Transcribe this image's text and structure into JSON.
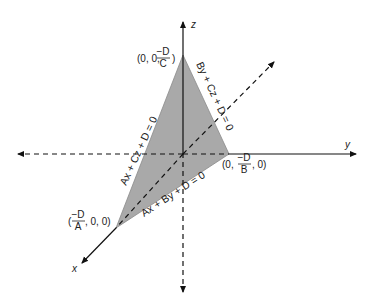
{
  "diagram": {
    "type": "3d-plane-intercepts",
    "colors": {
      "plane_fill": "#a9a9a9",
      "axis_line": "#111111",
      "label": "#222222",
      "background": "#ffffff"
    },
    "axes": {
      "x": {
        "label": "x"
      },
      "y": {
        "label": "y"
      },
      "z": {
        "label": "z"
      }
    },
    "intercepts": {
      "z": {
        "prefix": "(0, 0,",
        "num": "−D",
        "den": "C",
        "suffix": ")"
      },
      "y": {
        "prefix": "(0,",
        "num": "−D",
        "den": "B",
        "suffix": ", 0)"
      },
      "x": {
        "prefix": "(",
        "num": "−D",
        "den": "A",
        "suffix": ", 0, 0)"
      }
    },
    "trace_lines": {
      "yz": "By + Cz + D = 0",
      "xz": "Ax + Cz + D = 0",
      "xy": "Ax + By + D = 0"
    }
  }
}
